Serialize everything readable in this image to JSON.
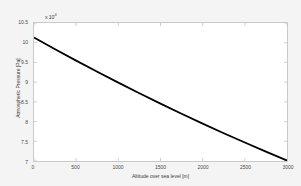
{
  "chart_data": {
    "type": "line",
    "title": "",
    "xlabel": "Altitude over sea level [m]",
    "ylabel": "Atmospheric Pressure [Pa]",
    "y_multiplier": "x 10",
    "y_multiplier_exponent": "4",
    "xlim": [
      0,
      3000
    ],
    "ylim": [
      70000,
      105000
    ],
    "xticks": [
      0,
      500,
      1000,
      1500,
      2000,
      2500,
      3000
    ],
    "xtick_labels": [
      "0",
      "500",
      "1000",
      "1500",
      "2000",
      "2500",
      "3000"
    ],
    "yticks": [
      70000,
      75000,
      80000,
      85000,
      90000,
      95000,
      100000,
      105000
    ],
    "ytick_labels": [
      "7",
      "7.5",
      "8",
      "8.5",
      "9",
      "9.5",
      "10",
      "10.5"
    ],
    "grid": false,
    "legend": null,
    "series": [
      {
        "name": "Atmospheric Pressure",
        "color": "#000000",
        "line_width": 1.8,
        "x": [
          0,
          250,
          500,
          750,
          1000,
          1250,
          1500,
          1750,
          2000,
          2250,
          2500,
          2750,
          3000
        ],
        "values": [
          101325,
          98360,
          95460,
          92630,
          89870,
          87180,
          84550,
          81990,
          79490,
          77050,
          74680,
          72360,
          70110
        ]
      }
    ]
  }
}
